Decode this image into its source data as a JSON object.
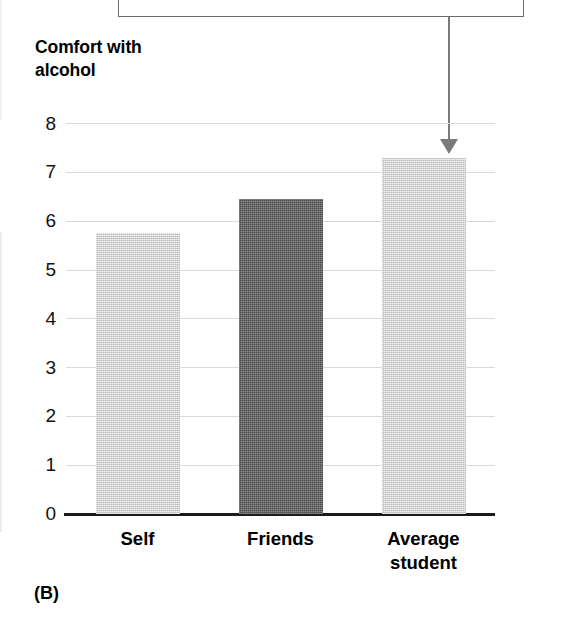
{
  "figure": {
    "panel_label": "(B)",
    "axis_title": "Comfort with\nalcohol"
  },
  "annotation": {
    "callout_box_present": true,
    "arrow_points_to": "Average student",
    "arrow_name": "callout-arrow"
  },
  "chart_data": {
    "type": "bar",
    "title": "Comfort with alcohol",
    "xlabel": "",
    "ylabel": "Comfort with alcohol",
    "categories": [
      "Self",
      "Friends",
      "Average\nstudent"
    ],
    "category_labels_flat": [
      "Self",
      "Friends",
      "Average student"
    ],
    "values": [
      5.75,
      6.45,
      7.3
    ],
    "bar_colors": [
      "#c9c9c9",
      "#666666",
      "#c9c9c9"
    ],
    "ylim": [
      0,
      8.2
    ],
    "yticks": [
      0,
      1,
      2,
      3,
      4,
      5,
      6,
      7,
      8
    ],
    "ytick_labels": [
      "0",
      "1",
      "2",
      "3",
      "4",
      "5",
      "6",
      "7",
      "8"
    ],
    "grid": true,
    "grid_color": "#d9d9d9",
    "legend": null,
    "axis_color": "#1a1a1a"
  },
  "colors": {
    "bar_light": "#c9c9c9",
    "bar_dark": "#666666",
    "gridline": "#d9d9d9",
    "axis": "#1a1a1a",
    "arrow": "#7a7a7a",
    "callout_border": "#6b6b6b",
    "text": "#000000"
  }
}
